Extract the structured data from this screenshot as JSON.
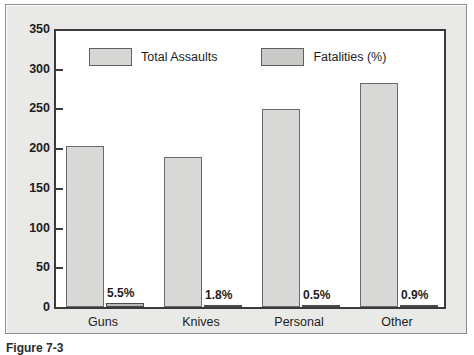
{
  "chart_data": {
    "type": "bar",
    "title": "",
    "subtitle": "",
    "xlabel": "",
    "ylabel": "",
    "ylim": [
      0,
      350
    ],
    "yticks": [
      0,
      50,
      100,
      150,
      200,
      250,
      300,
      350
    ],
    "grid": false,
    "legend_position": "top-left-inside",
    "categories": [
      "Guns",
      "Knives",
      "Personal",
      "Other"
    ],
    "series": [
      {
        "name": "Total Assaults",
        "values": [
          203,
          189,
          249,
          282
        ],
        "color": "#d8d8d6"
      },
      {
        "name": "Fatalities (%)",
        "values": [
          5.5,
          1.8,
          0.5,
          0.9
        ],
        "labels": [
          "5.5%",
          "1.8%",
          "0.5%",
          "0.9%"
        ],
        "color": "#b9b9b7"
      }
    ]
  },
  "legend": {
    "items": [
      {
        "label": "Total Assaults",
        "swatch": "legend-swatch-total"
      },
      {
        "label": "Fatalities (%)",
        "swatch": "legend-swatch-fatalities"
      }
    ]
  },
  "axis": {
    "y_tick_labels": [
      "350",
      "300",
      "250",
      "200",
      "150",
      "100",
      "50",
      "0"
    ],
    "x_tick_labels": [
      "Guns",
      "Knives",
      "Personal",
      "Other"
    ]
  },
  "data_labels": [
    "5.5%",
    "1.8%",
    "0.5%",
    "0.9%"
  ],
  "caption": {
    "prefix": "Figure 7-3",
    "rest": ""
  },
  "colors": {
    "panel_background": "#e9e9e7",
    "plot_background": "#ffffff",
    "axis_line": "#3a3a3a",
    "bar_total": "#d8d8d6",
    "bar_fatalities": "#b9b9b7",
    "text": "#1d1d1d"
  }
}
